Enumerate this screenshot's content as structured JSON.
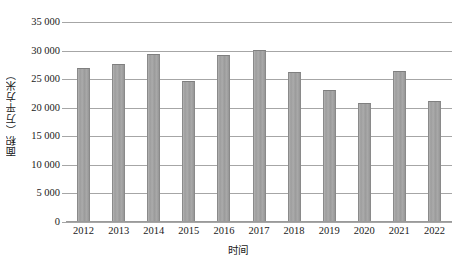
{
  "chart_data": {
    "type": "bar",
    "title": "",
    "xlabel": "时间",
    "ylabel": "面积（万平方米）",
    "categories": [
      "2012",
      "2013",
      "2014",
      "2015",
      "2016",
      "2017",
      "2018",
      "2019",
      "2020",
      "2021",
      "2022"
    ],
    "values": [
      26700,
      27400,
      29200,
      24500,
      29000,
      29900,
      26000,
      23000,
      20700,
      26300,
      21000
    ],
    "series": [
      {
        "name": "面积",
        "values": [
          26700,
          27400,
          29200,
          24500,
          29000,
          29900,
          26000,
          23000,
          20700,
          26300,
          21000
        ]
      }
    ],
    "ylim": [
      0,
      35000
    ],
    "ytick_values": [
      0,
      5000,
      10000,
      15000,
      20000,
      25000,
      30000,
      35000
    ],
    "ytick_labels": [
      "0",
      "5 000",
      "10 000",
      "15 000",
      "20 000",
      "25 000",
      "30 000",
      "35 000"
    ],
    "grid": true,
    "legend": false,
    "legend_position": "none",
    "bar_color": "#a3a3a3",
    "grid_color": "#a6a6a6",
    "axis_color": "#9a9a9a",
    "text_color": "#1a1a1a"
  }
}
